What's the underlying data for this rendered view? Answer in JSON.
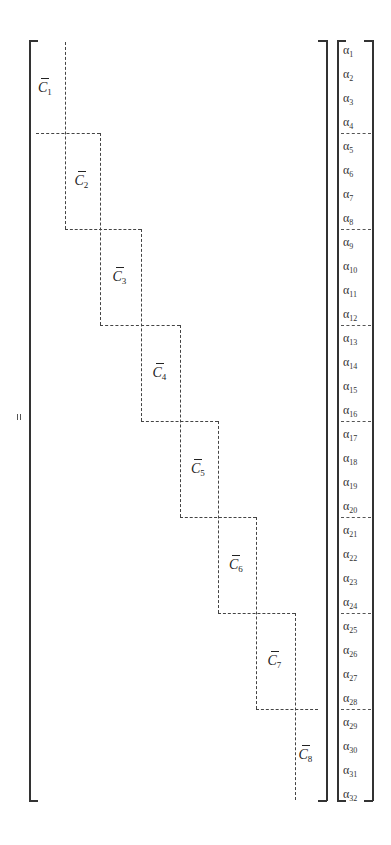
{
  "figure": {
    "equals_sign": "=",
    "matrix": {
      "block_symbol": "C",
      "blocks": [
        {
          "label": "C",
          "sub": "1",
          "x0": 36,
          "x1": 65,
          "y0": 42,
          "y1": 133
        },
        {
          "label": "C",
          "sub": "2",
          "x0": 65,
          "x1": 100,
          "y0": 133,
          "y1": 229
        },
        {
          "label": "C",
          "sub": "3",
          "x0": 100,
          "x1": 141,
          "y0": 229,
          "y1": 325
        },
        {
          "label": "C",
          "sub": "4",
          "x0": 141,
          "x1": 180,
          "y0": 325,
          "y1": 421
        },
        {
          "label": "C",
          "sub": "5",
          "x0": 180,
          "x1": 218,
          "y0": 421,
          "y1": 517
        },
        {
          "label": "C",
          "sub": "6",
          "x0": 218,
          "x1": 256,
          "y0": 517,
          "y1": 613
        },
        {
          "label": "C",
          "sub": "7",
          "x0": 256,
          "x1": 295,
          "y0": 613,
          "y1": 709
        },
        {
          "label": "C",
          "sub": "8",
          "x0": 295,
          "x1": 318,
          "y0": 709,
          "y1": 800
        }
      ]
    },
    "vector": {
      "symbol": "α",
      "entries": [
        "1",
        "2",
        "3",
        "4",
        "5",
        "6",
        "7",
        "8",
        "9",
        "10",
        "11",
        "12",
        "13",
        "14",
        "15",
        "16",
        "17",
        "18",
        "19",
        "20",
        "21",
        "22",
        "23",
        "24",
        "25",
        "26",
        "27",
        "28",
        "29",
        "30",
        "31",
        "32"
      ],
      "group_size": 4
    }
  }
}
